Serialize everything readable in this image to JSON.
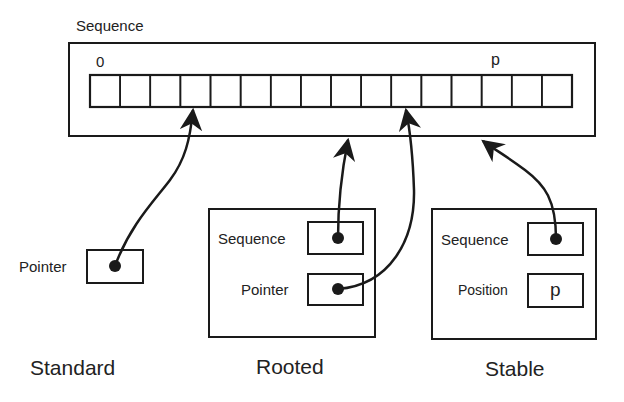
{
  "diagram": {
    "sequence": {
      "title": "Sequence",
      "cell_count": 16,
      "start_index_label": "0",
      "position_label": "p"
    },
    "standard": {
      "caption": "Standard",
      "field_label": "Pointer"
    },
    "rooted": {
      "caption": "Rooted",
      "fields": [
        {
          "label": "Sequence"
        },
        {
          "label": "Pointer"
        }
      ]
    },
    "stable": {
      "caption": "Stable",
      "fields": [
        {
          "label": "Sequence"
        },
        {
          "label": "Position",
          "value": "p"
        }
      ]
    },
    "colors": {
      "stroke": "#1a1a1a",
      "background": "#ffffff"
    }
  }
}
